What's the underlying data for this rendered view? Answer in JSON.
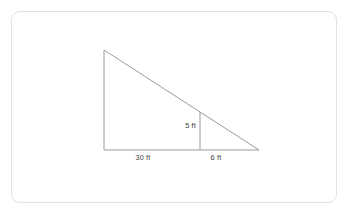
{
  "figure": {
    "kind": "geometry-diagram",
    "frame": {
      "border_color": "#e2e2e2",
      "background_color": "#ffffff",
      "corner_radius": 9
    },
    "line_color": "#9a9a9a",
    "text_color": "#3b3b3b",
    "labels": {
      "inner_height": "5 ft",
      "base_left": "30 ft",
      "base_right": "6 ft"
    },
    "points": {
      "apex": {
        "x": 104,
        "y": 50
      },
      "bottom_left": {
        "x": 104,
        "y": 150
      },
      "bottom_right": {
        "x": 259,
        "y": 150
      },
      "inner_top": {
        "x": 200,
        "y": 112
      },
      "inner_bottom": {
        "x": 200,
        "y": 150
      }
    },
    "label_positions": {
      "inner_height": {
        "x": 196,
        "y": 128
      },
      "base_left": {
        "x": 143,
        "y": 160
      },
      "base_right": {
        "x": 216,
        "y": 160
      }
    }
  }
}
